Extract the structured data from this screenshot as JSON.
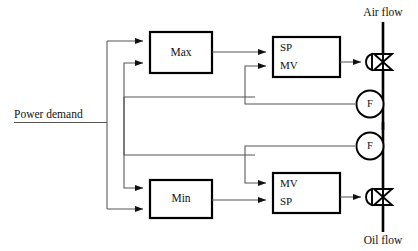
{
  "diagram": {
    "colors": {
      "line": "#000000",
      "signal": "#555555",
      "background": "#ffffff"
    },
    "blocks": {
      "max": {
        "label": "Max",
        "name": "max-selector-block"
      },
      "min": {
        "label": "Min",
        "name": "min-selector-block"
      },
      "air_controller": {
        "name": "air-flow-controller-block",
        "input_top": "SP",
        "input_bottom": "MV"
      },
      "oil_controller": {
        "name": "oil-flow-controller-block",
        "input_top": "MV",
        "input_bottom": "SP"
      }
    },
    "labels": {
      "power_demand": "Power demand",
      "air_flow": "Air flow",
      "oil_flow": "Oil flow"
    },
    "sensors": {
      "air_flow_meter": "F",
      "oil_flow_meter": "F"
    },
    "icons": {
      "air_valve": "control-valve-icon",
      "oil_valve": "control-valve-icon",
      "air_meter": "flow-transmitter-icon",
      "oil_meter": "flow-transmitter-icon"
    }
  }
}
